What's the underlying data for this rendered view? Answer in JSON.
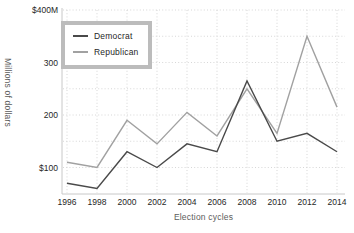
{
  "chart_data": {
    "type": "line",
    "title": "",
    "xlabel": "Election cycles",
    "ylabel": "Millions of dollars",
    "x": [
      1996,
      1998,
      2000,
      2002,
      2004,
      2006,
      2008,
      2010,
      2012,
      2014
    ],
    "series": [
      {
        "name": "Democrat",
        "color": "#4a4a4a",
        "values": [
          70,
          60,
          130,
          100,
          145,
          130,
          265,
          150,
          165,
          130
        ]
      },
      {
        "name": "Republican",
        "color": "#a1a1a1",
        "values": [
          110,
          100,
          190,
          145,
          205,
          160,
          250,
          165,
          350,
          215
        ]
      }
    ],
    "ylim": [
      50,
      400
    ],
    "yticks": [
      {
        "value": 100,
        "label": "$100"
      },
      {
        "value": 200,
        "label": "200"
      },
      {
        "value": 300,
        "label": "300"
      },
      {
        "value": 400,
        "label": "$400M"
      }
    ],
    "grid": true,
    "grid_step": 50,
    "legend_position": "top-left"
  },
  "styles": {
    "grid_color": "#d2d2d2",
    "spine_color": "#c8c8c8",
    "tick_text_color": "#262626",
    "axis_label_color": "#5c5c5c",
    "legend_border_color": "#bcbcbc",
    "background": "#ffffff"
  }
}
